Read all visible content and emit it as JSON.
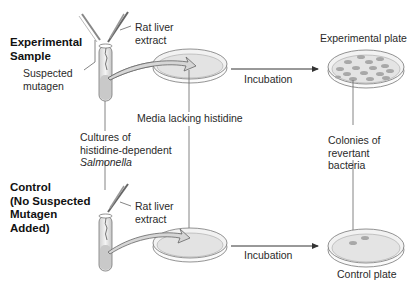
{
  "experimental": {
    "title_line1": "Experimental",
    "title_line2": "Sample",
    "mutagen_line1": "Suspected",
    "mutagen_line2": "mutagen",
    "liver_line1": "Rat liver",
    "liver_line2": "extract",
    "incubation": "Incubation",
    "plate_label": "Experimental plate",
    "colony_count": 16
  },
  "shared": {
    "media_label": "Media lacking histidine",
    "cultures_line1": "Cultures of",
    "cultures_line2": "histidine-dependent",
    "cultures_line3": "Salmonella",
    "colonies_line1": "Colonies of",
    "colonies_line2": "revertant",
    "colonies_line3": "bacteria"
  },
  "control": {
    "title_line1": "Control",
    "title_line2": "(No Suspected",
    "title_line3": "Mutagen",
    "title_line4": "Added)",
    "liver_line1": "Rat liver",
    "liver_line2": "extract",
    "incubation": "Incubation",
    "plate_label": "Control plate",
    "colony_count": 2
  },
  "colors": {
    "line": "#555555",
    "plate_fill": "#e4e4e4",
    "colony": "#a8a8a8",
    "arrow_fill": "#d0d0d0"
  }
}
